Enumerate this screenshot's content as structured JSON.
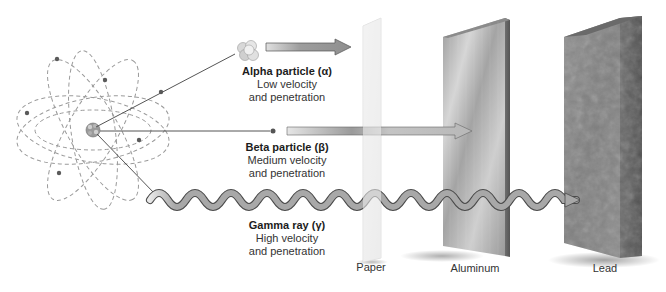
{
  "diagram": {
    "type": "radiation-penetration",
    "source": "atom-nucleus",
    "particles": [
      {
        "id": "alpha",
        "title": "Alpha particle (α)",
        "line1": "Low velocity",
        "line2": "and penetration",
        "stopped_by": "Paper"
      },
      {
        "id": "beta",
        "title": "Beta particle (β)",
        "line1": "Medium velocity",
        "line2": "and penetration",
        "stopped_by": "Aluminum"
      },
      {
        "id": "gamma",
        "title": "Gamma ray (γ)",
        "line1": "High velocity",
        "line2": "and penetration",
        "stopped_by": "Lead"
      }
    ],
    "barriers": [
      {
        "id": "paper",
        "label": "Paper"
      },
      {
        "id": "aluminum",
        "label": "Aluminum"
      },
      {
        "id": "lead",
        "label": "Lead"
      }
    ]
  },
  "colors": {
    "orbit": "#9a9a9a",
    "electron": "#555555",
    "ray_line": "#555555",
    "arrow_fill": "#a8a8a8",
    "paper": "#ececec",
    "aluminum": "#b4b4b4",
    "lead": "#858585"
  }
}
